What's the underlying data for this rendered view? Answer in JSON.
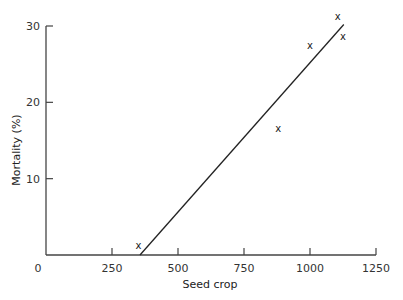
{
  "chart_data": {
    "type": "scatter",
    "title": "",
    "xlabel": "Seed crop",
    "ylabel": "Mortality (%)",
    "xlim": [
      0,
      1250
    ],
    "ylim": [
      0,
      30
    ],
    "xticks": [
      0,
      250,
      500,
      750,
      1000,
      1250
    ],
    "xtick_labels": [
      "0",
      "250",
      "500",
      "750",
      "1000",
      "1250"
    ],
    "yticks": [
      10,
      20,
      30
    ],
    "ytick_labels": [
      "10",
      "20",
      "30"
    ],
    "grid": false,
    "legend": null,
    "marker": "x",
    "points": [
      {
        "x": 350,
        "y": 1.2
      },
      {
        "x": 880,
        "y": 16.6
      },
      {
        "x": 1000,
        "y": 27.5
      },
      {
        "x": 1105,
        "y": 31.3
      },
      {
        "x": 1125,
        "y": 28.6
      }
    ],
    "fit_line": {
      "x": [
        356,
        1128
      ],
      "y": [
        0,
        30.2
      ]
    }
  },
  "axes": {
    "x_origin_label": "0"
  }
}
